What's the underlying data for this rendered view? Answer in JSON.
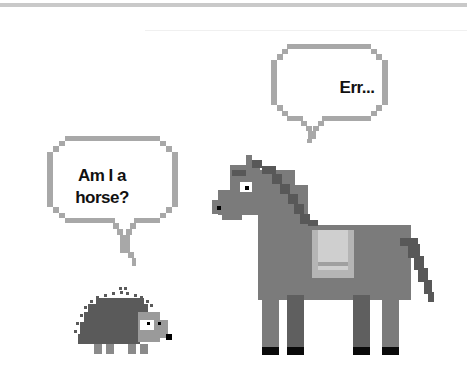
{
  "illustration": {
    "title": "Hedgehog asks horse",
    "bubbles": [
      {
        "speaker": "horse",
        "text": "Err..."
      },
      {
        "speaker": "hedgehog",
        "line1": "Am I a",
        "line2": "horse?"
      }
    ],
    "characters": [
      "horse",
      "hedgehog"
    ],
    "colors": {
      "bubble_border": "#a8a8a8",
      "horse_body": "#7b7b7b",
      "horse_mane": "#585858",
      "saddle_outer": "#b5b5b5",
      "saddle_inner": "#cfcfcf",
      "hooves": "#0a0a0a",
      "hedgehog_spines": "#5a5a5a",
      "hedgehog_face": "#9a9a9a"
    }
  }
}
